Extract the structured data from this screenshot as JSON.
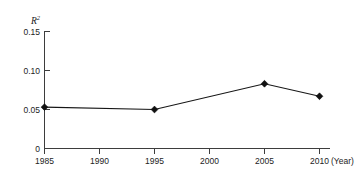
{
  "chart_data": {
    "type": "line",
    "title": "",
    "subtitle": "",
    "xlabel": "(Year)",
    "ylabel": "R",
    "ylabel_superscript": "2",
    "ylabel_full": "R²",
    "x": [
      1985,
      1995,
      2005,
      2010
    ],
    "values": [
      0.053,
      0.05,
      0.083,
      0.067
    ],
    "series": [
      {
        "name": "R²",
        "x": [
          1985,
          1995,
          2005,
          2010
        ],
        "values": [
          0.053,
          0.05,
          0.083,
          0.067
        ]
      }
    ],
    "xlim": [
      1985,
      2010
    ],
    "ylim": [
      0,
      0.15
    ],
    "xticks": [
      1985,
      1990,
      1995,
      2000,
      2005,
      2010
    ],
    "xticklabels": [
      "1985",
      "1990",
      "1995",
      "2000",
      "2005",
      "2010"
    ],
    "yticks": [
      0,
      0.05,
      0.1,
      0.15
    ],
    "yticklabels": [
      "0",
      "0.05",
      "0.10",
      "0.15"
    ],
    "grid": false,
    "legend": false,
    "legend_position": "none",
    "marker": "diamond",
    "line_color": "#161616",
    "marker_color": "#111111",
    "axis_color": "#3d3d3d",
    "background_color": "#ffffff",
    "annotations": []
  },
  "axes": {
    "y_ticks": [
      {
        "label": "0.15",
        "value": 0.15
      },
      {
        "label": "0.10",
        "value": 0.1
      },
      {
        "label": "0.05",
        "value": 0.05
      },
      {
        "label": "0",
        "value": 0
      }
    ],
    "x_ticks": [
      {
        "label": "1985",
        "value": 1985
      },
      {
        "label": "1990",
        "value": 1990
      },
      {
        "label": "1995",
        "value": 1995
      },
      {
        "label": "2000",
        "value": 2000
      },
      {
        "label": "2005",
        "value": 2005
      },
      {
        "label": "2010",
        "value": 2010
      }
    ],
    "x_unit_label": "(Year)",
    "y_axis_title": "R",
    "y_axis_title_sup": "2"
  },
  "points": [
    {
      "x": 1985,
      "y": 0.053,
      "label": ""
    },
    {
      "x": 1995,
      "y": 0.05,
      "label": ""
    },
    {
      "x": 2005,
      "y": 0.083,
      "label": ""
    },
    {
      "x": 2010,
      "y": 0.067,
      "label": ""
    }
  ]
}
